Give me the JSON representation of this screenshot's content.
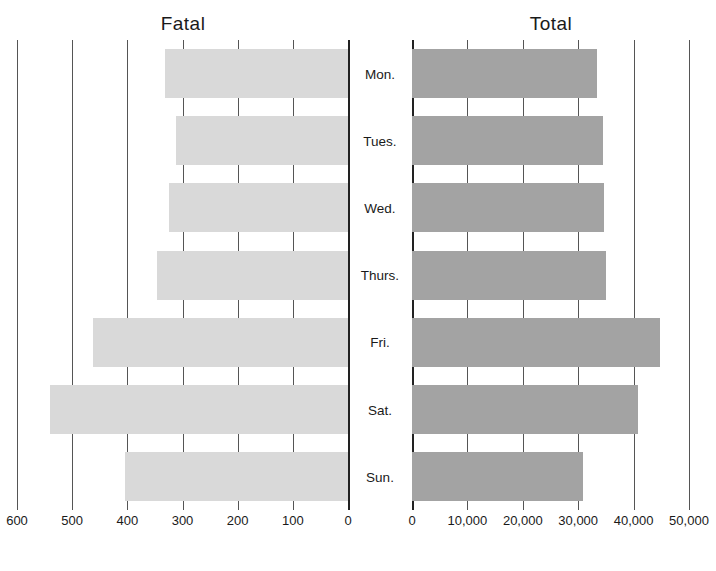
{
  "chart_data": [
    {
      "type": "bar",
      "orientation": "horizontal",
      "direction": "right-to-left",
      "title": "Fatal",
      "categories": [
        "Mon.",
        "Tues.",
        "Wed.",
        "Thurs.",
        "Fri.",
        "Sat.",
        "Sun."
      ],
      "values": [
        332,
        312,
        324,
        346,
        462,
        540,
        404
      ],
      "xlim": [
        0,
        600
      ],
      "xticks": [
        "600",
        "500",
        "400",
        "300",
        "200",
        "100",
        "0"
      ],
      "grid": true,
      "color": "#d9d9d9"
    },
    {
      "type": "bar",
      "orientation": "horizontal",
      "direction": "left-to-right",
      "title": "Total",
      "categories": [
        "Mon.",
        "Tues.",
        "Wed.",
        "Thurs.",
        "Fri.",
        "Sat.",
        "Sun."
      ],
      "values": [
        33400,
        34500,
        34600,
        35000,
        44800,
        40800,
        30900
      ],
      "xlim": [
        0,
        50000
      ],
      "xticks": [
        "0",
        "10,000",
        "20,000",
        "30,000",
        "40,000",
        "50,000"
      ],
      "grid": true,
      "color": "#a3a3a3"
    }
  ],
  "labels": {
    "fatal_title": "Fatal",
    "total_title": "Total",
    "days": [
      "Mon.",
      "Tues.",
      "Wed.",
      "Thurs.",
      "Fri.",
      "Sat.",
      "Sun."
    ],
    "fatal_ticks": [
      "600",
      "500",
      "400",
      "300",
      "200",
      "100",
      "0"
    ],
    "total_ticks": [
      "0",
      "10,000",
      "20,000",
      "30,000",
      "40,000",
      "50,000"
    ]
  }
}
